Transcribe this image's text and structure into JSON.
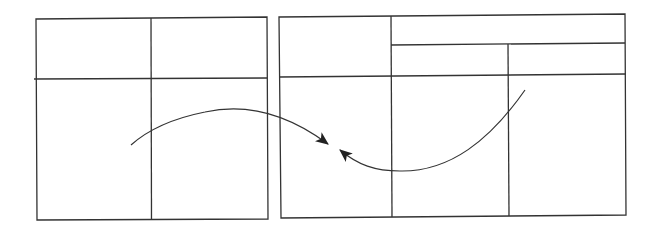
{
  "diagram": {
    "stroke_color": "#222222",
    "background": "#ffffff",
    "left_table": {
      "label": "",
      "columns": 2,
      "rows": 2
    },
    "right_table": {
      "label": "",
      "columns": 3,
      "header_rows": 2,
      "body_rows": 1
    },
    "arrows": [
      {
        "from": "left-table",
        "to": "center-gap",
        "direction": "right"
      },
      {
        "from": "right-table",
        "to": "center-gap",
        "direction": "left"
      }
    ]
  }
}
